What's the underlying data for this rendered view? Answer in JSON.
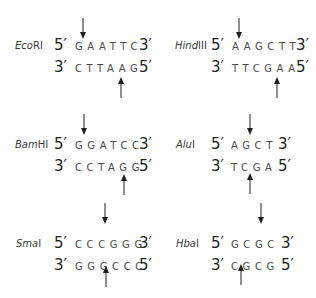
{
  "enzymes": [
    {
      "name_italic": "Eco",
      "name_roman": "RI",
      "top": {
        "five": "5′",
        "seq": "GAATTC",
        "three": "3′"
      },
      "bottom": {
        "three": "3′",
        "seq": "CTTAAG",
        "five": "5′"
      },
      "cut_top_after": 1,
      "cut_bottom_after": 5
    },
    {
      "name_italic": "Hind",
      "name_roman": "III",
      "top": {
        "five": "5′",
        "seq": "AAGCTT",
        "three": "3′"
      },
      "bottom": {
        "three": "3′",
        "seq": "TTCGAA",
        "five": "5′"
      },
      "cut_top_after": 1,
      "cut_bottom_after": 5
    },
    {
      "name_italic": "Bam",
      "name_roman": "HI",
      "top": {
        "five": "5′",
        "seq": "GGATCC",
        "three": "3′"
      },
      "bottom": {
        "three": "3′",
        "seq": "CCTAGG",
        "five": "5′"
      },
      "cut_top_after": 1,
      "cut_bottom_after": 5
    },
    {
      "name_italic": "Alu",
      "name_roman": "I",
      "top": {
        "five": "5′",
        "seq": "AGCT",
        "three": "3′"
      },
      "bottom": {
        "three": "3′",
        "seq": "TCGA",
        "five": "5′"
      },
      "cut_top_after": 2,
      "cut_bottom_after": 2
    },
    {
      "name_italic": "Sma",
      "name_roman": "I",
      "top": {
        "five": "5′",
        "seq": "CCCGGG",
        "three": "3′"
      },
      "bottom": {
        "three": "3′",
        "seq": "GGGCCC",
        "five": "5′"
      },
      "cut_top_after": 3,
      "cut_bottom_after": 3
    },
    {
      "name_italic": "Hba",
      "name_roman": "I",
      "top": {
        "five": "5′",
        "seq": "GCGC",
        "three": "3′"
      },
      "bottom": {
        "three": "3′",
        "seq": "CGCG",
        "five": "5′"
      },
      "cut_top_after": 3,
      "cut_bottom_after": 1
    }
  ],
  "colors": {
    "text": "#231f20",
    "sequence": "#4a4a4a",
    "arrow": "#231f20"
  }
}
